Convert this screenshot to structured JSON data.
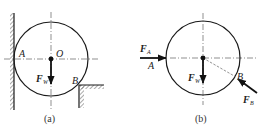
{
  "figures": [
    {
      "id": "a",
      "caption": "(a)",
      "labels": {
        "center": "O",
        "contact_left": "A",
        "contact_step": "B",
        "weight": "F",
        "weight_sub": "W"
      }
    },
    {
      "id": "b",
      "caption": "(b)",
      "labels": {
        "contact_left": "A",
        "contact_step": "B",
        "weight": "F",
        "weight_sub": "W",
        "force_a": "F",
        "force_a_sub": "A",
        "force_b": "F",
        "force_b_sub": "B"
      }
    }
  ],
  "colors": {
    "stroke": "#1a1a1a",
    "hatch": "#555555",
    "dashed": "#777777"
  }
}
